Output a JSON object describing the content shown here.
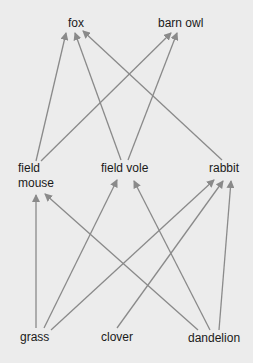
{
  "diagram": {
    "type": "food-web",
    "colors": {
      "background": "#ececec",
      "arrow": "#8a8a8a",
      "text": "#1a1a1a"
    },
    "nodes": {
      "fox": {
        "label": "fox",
        "level": "top-predator"
      },
      "barn_owl": {
        "label": "barn owl",
        "level": "top-predator"
      },
      "field_mouse": {
        "label_line1": "field",
        "label_line2": "mouse",
        "level": "herbivore"
      },
      "field_vole": {
        "label": "field vole",
        "level": "herbivore"
      },
      "rabbit": {
        "label": "rabbit",
        "level": "herbivore"
      },
      "grass": {
        "label": "grass",
        "level": "producer"
      },
      "clover": {
        "label": "clover",
        "level": "producer"
      },
      "dandelion": {
        "label": "dandelion",
        "level": "producer"
      }
    },
    "edges": [
      {
        "from": "grass",
        "to": "field mouse"
      },
      {
        "from": "grass",
        "to": "field vole"
      },
      {
        "from": "grass",
        "to": "rabbit"
      },
      {
        "from": "clover",
        "to": "rabbit"
      },
      {
        "from": "dandelion",
        "to": "field mouse"
      },
      {
        "from": "dandelion",
        "to": "field vole"
      },
      {
        "from": "dandelion",
        "to": "rabbit"
      },
      {
        "from": "field mouse",
        "to": "fox"
      },
      {
        "from": "field mouse",
        "to": "barn owl"
      },
      {
        "from": "field vole",
        "to": "fox"
      },
      {
        "from": "field vole",
        "to": "barn owl"
      },
      {
        "from": "rabbit",
        "to": "fox"
      }
    ]
  }
}
